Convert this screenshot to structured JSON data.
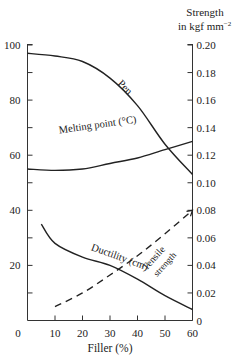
{
  "chart_data": {
    "type": "line",
    "title": "",
    "xlabel": "Filler (%)",
    "ylabel_left": "",
    "ylabel_right": "Strength in kgf mm⁻²",
    "right_axis_title_line1": "Strength",
    "right_axis_title_line2": "in kgf mm",
    "right_axis_title_sup": "−2",
    "xlim": [
      0,
      60
    ],
    "ylim_left": [
      0,
      100
    ],
    "ylim_right": [
      0,
      0.2
    ],
    "x_ticks": [
      "0",
      "10",
      "20",
      "30",
      "40",
      "50",
      "60"
    ],
    "y_left_ticks": [
      "100",
      "80",
      "60",
      "40",
      "20"
    ],
    "y_left_tick_values": [
      100,
      90,
      80,
      70,
      60,
      50,
      40,
      30,
      20,
      10
    ],
    "y_right_ticks": [
      "0.20",
      "0.18",
      "0.16",
      "0.14",
      "0.12",
      "0.10",
      "0.08",
      "0.06",
      "0.04",
      "0.02",
      "0"
    ],
    "grid": false,
    "legend": "none (curves labelled inline)",
    "series": [
      {
        "name": "Pen",
        "axis": "left",
        "style": "solid",
        "x": [
          0,
          10,
          20,
          30,
          40,
          50,
          60
        ],
        "values": [
          97,
          96,
          94,
          88,
          78,
          64,
          53
        ]
      },
      {
        "name": "Melting point (°C)",
        "axis": "left",
        "style": "solid",
        "x": [
          0,
          10,
          20,
          30,
          40,
          50,
          60
        ],
        "values": [
          55,
          54.5,
          55,
          57,
          59,
          62,
          65
        ]
      },
      {
        "name": "Ductility (cm)",
        "axis": "left",
        "style": "solid",
        "x": [
          5,
          10,
          20,
          30,
          40,
          50,
          60
        ],
        "values": [
          35,
          28,
          23,
          20,
          15,
          9,
          4
        ]
      },
      {
        "name": "Tensile strength",
        "axis": "right",
        "style": "dashed",
        "x": [
          10,
          20,
          30,
          40,
          50,
          60
        ],
        "values": [
          0.01,
          0.02,
          0.033,
          0.047,
          0.063,
          0.08
        ]
      }
    ],
    "annotations": [
      "Pen",
      "Melting point (°C)",
      "Ductility (cm)",
      "Tensile",
      "strength"
    ]
  }
}
